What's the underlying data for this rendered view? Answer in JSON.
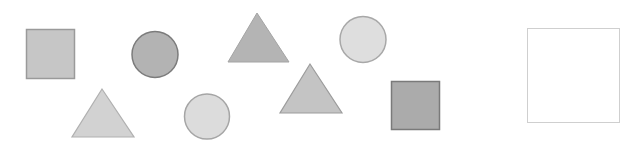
{
  "scene": {
    "description": "Puzzle panel of grey geometric shapes and an empty answer box",
    "shapes": [
      {
        "id": "square-1",
        "kind": "square",
        "shade": "light-medium",
        "fill": "#c6c6c6",
        "stroke": "#9a9a9a"
      },
      {
        "id": "circle-1",
        "kind": "circle",
        "shade": "medium",
        "fill": "#b3b3b3",
        "stroke": "#7c7c7c"
      },
      {
        "id": "triangle-1",
        "kind": "triangle",
        "shade": "medium",
        "fill": "#b4b4b4",
        "stroke": "#a4a4a4"
      },
      {
        "id": "circle-2",
        "kind": "circle",
        "shade": "light",
        "fill": "#dedede",
        "stroke": "#a8a8a8"
      },
      {
        "id": "triangle-2",
        "kind": "triangle",
        "shade": "light",
        "fill": "#d2d2d2",
        "stroke": "#b0b0b0"
      },
      {
        "id": "circle-3",
        "kind": "circle",
        "shade": "light",
        "fill": "#dcdcdc",
        "stroke": "#a5a5a5"
      },
      {
        "id": "triangle-3",
        "kind": "triangle",
        "shade": "light-medium",
        "fill": "#c4c4c4",
        "stroke": "#9c9c9c"
      },
      {
        "id": "square-2",
        "kind": "square",
        "shade": "dark",
        "fill": "#ababab",
        "stroke": "#7a7a7a"
      }
    ],
    "answer_box": {
      "id": "answer-box",
      "kind": "empty-square",
      "fill": "#ffffff",
      "stroke": "#cfcfcf"
    }
  }
}
